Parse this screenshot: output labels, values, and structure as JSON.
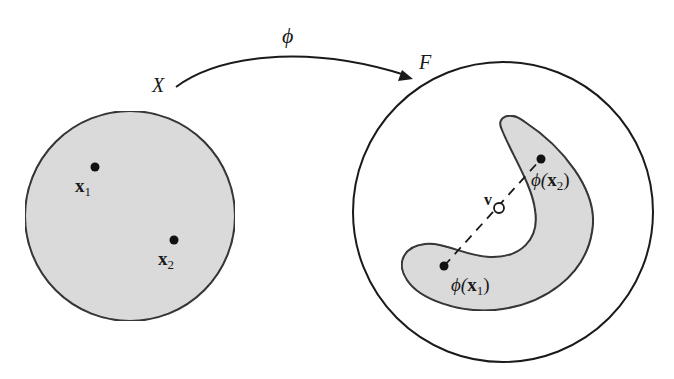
{
  "diagram": {
    "type": "kernel-feature-map-illustration",
    "colors": {
      "stroke": "#1a1a1a",
      "fill_region": "#dcdcdc",
      "background": "#ffffff"
    },
    "mapping": {
      "label": "ϕ",
      "from": "X",
      "to": "F"
    },
    "input_space": {
      "label": "X",
      "points": [
        {
          "id": "x1",
          "label_main": "x",
          "label_sub": "1"
        },
        {
          "id": "x2",
          "label_main": "x",
          "label_sub": "2"
        }
      ]
    },
    "feature_space": {
      "label": "F",
      "points": [
        {
          "id": "phi_x2",
          "label_func": "ϕ(",
          "label_main": "x",
          "label_sub": "2",
          "label_close": ")"
        },
        {
          "id": "phi_x1",
          "label_func": "ϕ(",
          "label_main": "x",
          "label_sub": "1",
          "label_close": ")"
        }
      ],
      "midpoint": {
        "id": "v",
        "label": "v"
      }
    }
  }
}
